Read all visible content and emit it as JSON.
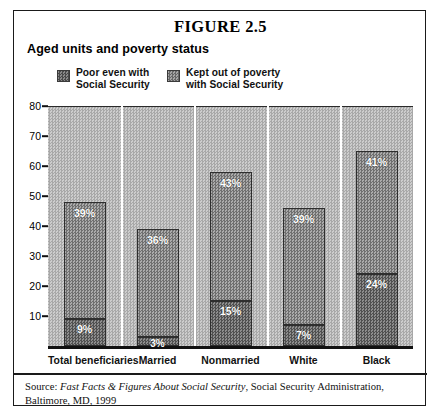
{
  "figure": {
    "number": "FIGURE 2.5",
    "subtitle": "Aged units and poverty status"
  },
  "legend": {
    "items": [
      {
        "label_line1": "Poor even with",
        "label_line2": "Social Security",
        "swatch": "poor-swatch"
      },
      {
        "label_line1": "Kept out of poverty",
        "label_line2": "with Social Security",
        "swatch": "kept-swatch"
      }
    ]
  },
  "source": {
    "prefix": "Source: ",
    "italic_title": "Fast Facts & Figures About Social Security",
    "rest": ", Social Security Administration, Baltimore, MD, 1999"
  },
  "chart_data": {
    "type": "bar",
    "stacked": true,
    "title": "Aged units and poverty status",
    "xlabel": "",
    "ylabel": "",
    "ylim": [
      0,
      80
    ],
    "yticks": [
      0,
      10,
      20,
      30,
      40,
      50,
      60,
      70,
      80
    ],
    "ytick_labels": [
      "",
      "10",
      "20",
      "30",
      "40",
      "50",
      "60",
      "70",
      "80"
    ],
    "grid": "vertical-white-separators",
    "legend_position": "top",
    "categories": [
      "Total beneficiaries",
      "Married",
      "Nonmarried",
      "White",
      "Black"
    ],
    "series": [
      {
        "name": "Poor even with Social Security",
        "values": [
          9,
          3,
          15,
          7,
          24
        ],
        "labels": [
          "9%",
          "3%",
          "15%",
          "7%",
          "24%"
        ]
      },
      {
        "name": "Kept out of poverty with Social Security",
        "values": [
          39,
          36,
          43,
          39,
          41
        ],
        "labels": [
          "39%",
          "36%",
          "43%",
          "39%",
          "41%"
        ]
      }
    ],
    "totals": [
      48,
      39,
      58,
      46,
      65
    ]
  },
  "colors": {
    "poor_fill": "#6f6f6f",
    "kept_fill": "#8d8d8d",
    "plot_background": "#b9b9b9",
    "frame": "#1a1a1a",
    "label_text": "#ffffff"
  }
}
